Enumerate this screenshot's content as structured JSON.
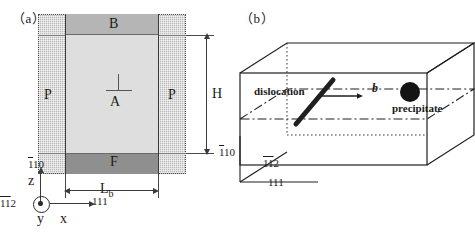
{
  "figure": {
    "panel_a": {
      "tag": "（a）",
      "regions": {
        "top_band": "B",
        "interior": "A",
        "bottom_band": "F",
        "pad_left": "P",
        "pad_right": "P"
      },
      "dimensions": {
        "height_label": "H",
        "width_label": "L",
        "width_subscript": "b"
      },
      "dislocation_symbol": "perpendicular-tack",
      "axes": {
        "z_label": "z",
        "x_label": "x",
        "y_label": "y",
        "z_miller": {
          "d1": "1",
          "d1_bar": true,
          "d2": "1",
          "d2_bar": false,
          "d3": "0"
        },
        "y_miller": {
          "d1": "1",
          "d1_bar": true,
          "d2": "1",
          "d2_bar": true,
          "d3": "2"
        },
        "x_miller": {
          "d1": "1",
          "d1_bar": false,
          "d2": "1",
          "d2_bar": false,
          "d3": "1"
        }
      }
    },
    "panel_b": {
      "tag": "（b）",
      "annotations": {
        "dislocation": "dislocation",
        "precipitate": "precipitate",
        "burgers_vector": "b"
      },
      "axes": {
        "vertical_miller": {
          "d1": "1",
          "d1_bar": true,
          "d2": "1",
          "d2_bar": false,
          "d3": "0"
        },
        "depth_miller": {
          "d1": "1",
          "d1_bar": true,
          "d2": "1",
          "d2_bar": true,
          "d3": "2"
        },
        "horizontal_miller": {
          "d1": "1",
          "d1_bar": false,
          "d2": "1",
          "d2_bar": false,
          "d3": "1"
        }
      }
    }
  },
  "colors": {
    "pad_gray": "#b9b9b9",
    "band_b_gray": "#b5b5b5",
    "interior_gray": "#dedede",
    "band_f_gray": "#8f8f8f",
    "ink": "#1a1a1a",
    "precipitate_fill": "#141414"
  }
}
